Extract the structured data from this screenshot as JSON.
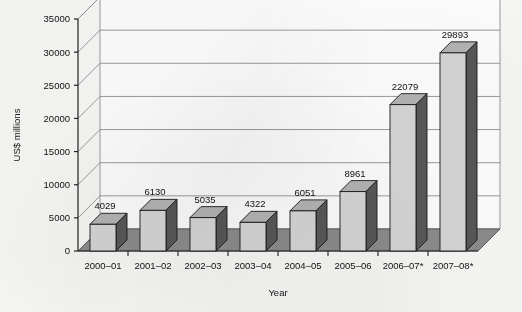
{
  "chart_data": {
    "type": "bar",
    "title": "",
    "xlabel": "Year",
    "ylabel": "US$ millions",
    "categories": [
      "2000–01",
      "2001–02",
      "2002–03",
      "2003–04",
      "2004–05",
      "2005–06",
      "2006–07*",
      "2007–08*"
    ],
    "values": [
      4029,
      6130,
      5035,
      4322,
      6051,
      8961,
      22079,
      29893
    ],
    "value_labels": [
      "4029",
      "6130",
      "5035",
      "4322",
      "6051",
      "8961",
      "22079",
      "29893"
    ],
    "ylim": [
      0,
      35000
    ],
    "ytick_values": [
      0,
      5000,
      10000,
      15000,
      20000,
      25000,
      30000,
      35000
    ],
    "ytick_labels": [
      "0",
      "5000",
      "10000",
      "15000",
      "20000",
      "25000",
      "30000",
      "35000"
    ],
    "grid": true,
    "legend": null,
    "legend_position": "none",
    "style": "3d-column",
    "colors": {
      "bar_front": "#d6d6d6",
      "bar_side": "#585858",
      "bar_top": "#b4b4b4",
      "bar_outline": "#1a1a1a",
      "floor": "#8c8c8c",
      "floor_edge": "#5a5a5a",
      "wall": "#fdfdfd",
      "gridline": "#8f8f8f",
      "axis": "#222222",
      "background": "#f7f7f5",
      "text": "#111111"
    }
  }
}
